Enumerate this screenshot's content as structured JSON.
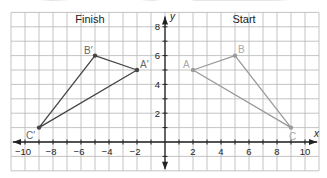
{
  "diagram": {
    "type": "coordinate-plane-reflection",
    "panel_labels": {
      "left": "Finish",
      "right": "Start"
    },
    "axes": {
      "x_label": "x",
      "y_label": "y",
      "x_ticks": [
        "−10",
        "−8",
        "−6",
        "−4",
        "−2",
        "2",
        "4",
        "6",
        "8",
        "10"
      ],
      "x_tick_values": [
        -10,
        -8,
        -6,
        -4,
        -2,
        2,
        4,
        6,
        8,
        10
      ],
      "y_ticks": [
        "2",
        "4",
        "6",
        "8"
      ],
      "y_tick_values": [
        2,
        4,
        6,
        8
      ],
      "grid_x_range": [
        -11,
        11
      ],
      "grid_y_range": [
        -2,
        9
      ]
    },
    "start_triangle": {
      "color": "#9a9a9a",
      "label_color": "#a8a8a8",
      "vertices": [
        {
          "label": "A",
          "x": 2,
          "y": 5
        },
        {
          "label": "B",
          "x": 5,
          "y": 6
        },
        {
          "label": "C",
          "x": 9,
          "y": 1
        }
      ]
    },
    "finish_triangle": {
      "color": "#444444",
      "label_color": "#666666",
      "vertices": [
        {
          "label": "A′",
          "x": -2,
          "y": 5
        },
        {
          "label": "B′",
          "x": -5,
          "y": 6
        },
        {
          "label": "C′",
          "x": -9,
          "y": 1
        }
      ]
    },
    "colors": {
      "grid": "#b5b5b5",
      "axis": "#222222",
      "text": "#222222",
      "background": "#ffffff"
    }
  }
}
